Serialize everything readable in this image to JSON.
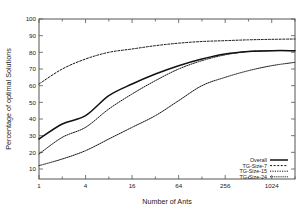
{
  "chart_data": {
    "type": "line",
    "title": "",
    "xlabel": "Number of Ants",
    "ylabel": "Percentage of optimal Solutions",
    "xscale": "log2",
    "xlim": [
      1,
      2048
    ],
    "ylim": [
      4,
      100
    ],
    "grid": false,
    "legend_position": "bottom-right",
    "xticks": [
      "1",
      "4",
      "16",
      "64",
      "256",
      "1024"
    ],
    "xtick_values": [
      1,
      4,
      16,
      64,
      256,
      1024
    ],
    "yticks": [
      "10",
      "20",
      "30",
      "40",
      "50",
      "60",
      "70",
      "80",
      "90",
      "100"
    ],
    "ytick_values": [
      10,
      20,
      30,
      40,
      50,
      60,
      70,
      80,
      90,
      100
    ],
    "x": [
      1,
      2,
      4,
      8,
      16,
      32,
      64,
      128,
      256,
      512,
      1024,
      2048
    ],
    "series": [
      {
        "name": "Overall",
        "style": "solid",
        "values": [
          28,
          37,
          42,
          54,
          61,
          67,
          72,
          76,
          79,
          80.5,
          81,
          81
        ]
      },
      {
        "name": "TG-Size-7",
        "style": "dotted",
        "values": [
          61,
          70,
          76,
          80,
          82,
          84,
          85.5,
          86.5,
          87,
          87.5,
          87.8,
          88
        ]
      },
      {
        "name": "TG-Size-15",
        "style": "dotted-fine",
        "values": [
          19,
          29,
          35,
          46,
          55,
          63,
          70,
          75,
          78.5,
          80.5,
          81,
          81
        ]
      },
      {
        "name": "TG-Size-24",
        "style": "dashed",
        "values": [
          12,
          16,
          21,
          28,
          35,
          42,
          51,
          60,
          65,
          69,
          72,
          74
        ]
      }
    ]
  },
  "legend": {
    "entries": [
      {
        "label": "Overall"
      },
      {
        "label": "TG-Size-7"
      },
      {
        "label": "TG-Size-15"
      },
      {
        "label": "TG-Size-24"
      }
    ]
  }
}
